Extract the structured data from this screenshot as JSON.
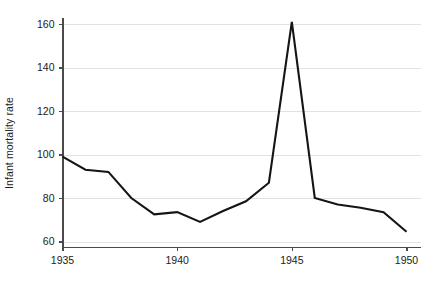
{
  "chart_data": {
    "type": "line",
    "title": "",
    "xlabel": "",
    "ylabel": "Infant mortality rate",
    "x": [
      1935,
      1936,
      1937,
      1938,
      1939,
      1940,
      1941,
      1942,
      1943,
      1944,
      1945,
      1946,
      1947,
      1948,
      1949,
      1950
    ],
    "values": [
      99,
      93,
      92,
      80,
      72.5,
      73.5,
      69,
      74,
      78.5,
      87,
      161,
      80,
      77,
      75.5,
      73.5,
      64.5
    ],
    "series": [
      {
        "name": "Infant mortality rate",
        "values": [
          99,
          93,
          92,
          80,
          72.5,
          73.5,
          69,
          74,
          78.5,
          87,
          161,
          80,
          77,
          75.5,
          73.5,
          64.5
        ]
      }
    ],
    "xlim": [
      1935,
      1950
    ],
    "ylim": [
      57,
      165
    ],
    "xticks": [
      1935,
      1940,
      1945,
      1950
    ],
    "xtick_labels": [
      "1935",
      "1940",
      "1945",
      "1950"
    ],
    "yticks": [
      60,
      80,
      100,
      120,
      140,
      160
    ],
    "ytick_labels": [
      "60",
      "80",
      "100",
      "120",
      "140",
      "160"
    ],
    "grid": "horizontal",
    "legend": "none",
    "line_color": "#151515",
    "grid_color": "#e2e2e2",
    "axis_color": "#4a4a4a",
    "background": "#ffffff"
  }
}
